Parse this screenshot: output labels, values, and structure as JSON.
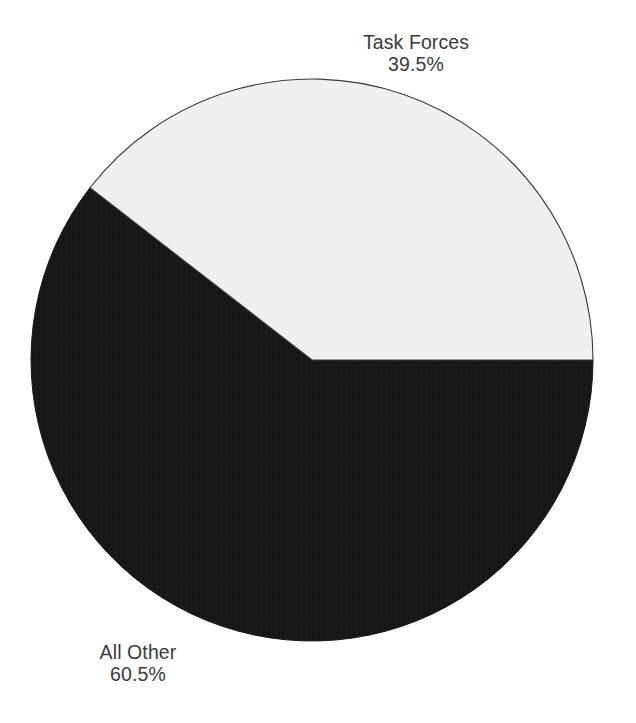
{
  "chart_data": {
    "type": "pie",
    "title": "",
    "subtitle": "",
    "xlabel": "",
    "ylabel": "",
    "legend_position": "none",
    "grid": false,
    "unit": "%",
    "total": 100,
    "start_angle_deg": 0,
    "direction": "counterclockwise",
    "categories": [
      "Task Forces",
      "All Other"
    ],
    "values": [
      39.5,
      60.5
    ],
    "slices": [
      {
        "label": "Task Forces",
        "value": 39.5,
        "value_text": "39.5%",
        "color": "#efefef",
        "edge_color": "#3a3a3a",
        "sweep_deg": 142.2,
        "start_deg": 0,
        "end_deg": 142.2,
        "label_position": "top-right"
      },
      {
        "label": "All Other",
        "value": 60.5,
        "value_text": "60.5%",
        "color": "#1a1a1a",
        "edge_color": "#1a1a1a",
        "sweep_deg": 217.8,
        "start_deg": 142.2,
        "end_deg": 360.0,
        "label_position": "bottom-left"
      }
    ],
    "annotations": []
  },
  "figure": {
    "background": "#ffffff",
    "text_color": "#3b3b3b",
    "center_x": 312,
    "center_y": 360,
    "radius": 281
  },
  "labels": {
    "task_forces": {
      "name": "Task Forces",
      "value": "39.5%"
    },
    "all_other": {
      "name": "All Other",
      "value": "60.5%"
    }
  }
}
